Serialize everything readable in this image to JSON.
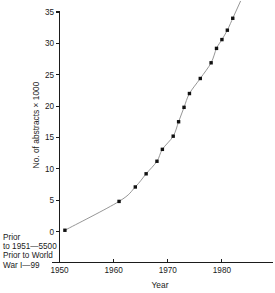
{
  "chart_data": {
    "type": "line",
    "title": "",
    "xlabel": "Year",
    "ylabel": "No. of abstracts × 1000",
    "xlim": [
      1950,
      1985
    ],
    "ylim": [
      0,
      35
    ],
    "xticks": [
      1950,
      1960,
      1970,
      1980
    ],
    "xticklabels": [
      "1950",
      "1960",
      "1970",
      "1980"
    ],
    "yticks": [
      0,
      5,
      10,
      15,
      20,
      25,
      30,
      35
    ],
    "yticklabels": [
      "0",
      "5",
      "10",
      "15",
      "20",
      "25",
      "30",
      "35"
    ],
    "grid": false,
    "legend": null,
    "marker": "square",
    "x": [
      1951,
      1961,
      1964,
      1966,
      1968,
      1969,
      1971,
      1972,
      1973,
      1974,
      1976,
      1978,
      1979,
      1980,
      1981,
      1982
    ],
    "values": [
      0.2,
      4.8,
      7.1,
      9.2,
      11.2,
      13.1,
      15.2,
      17.5,
      19.8,
      22.0,
      24.4,
      26.9,
      29.2,
      30.6,
      32.1,
      34.0
    ],
    "annotations": [
      "Prior",
      "to 1951—5500",
      "Prior to World",
      "War I—99"
    ]
  },
  "colors": {
    "axis": "#1b1b1b",
    "curve": "#8a8a8a",
    "marker": "#111111",
    "background": "#ffffff"
  }
}
